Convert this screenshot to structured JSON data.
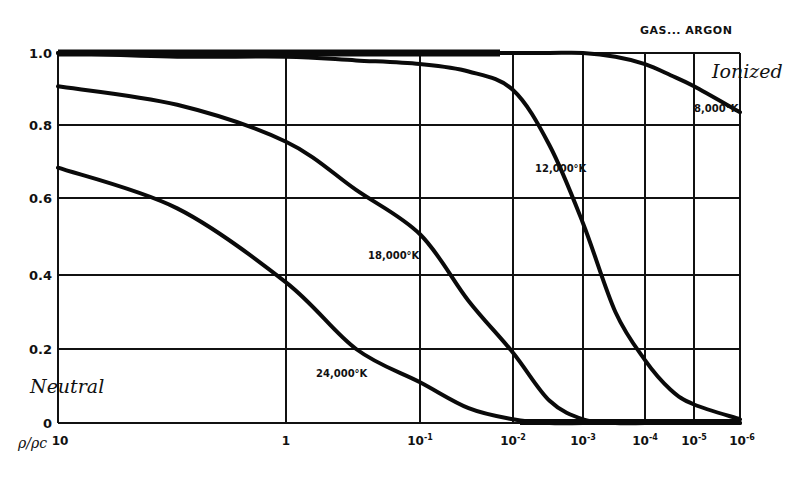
{
  "chart_data": {
    "type": "line",
    "title": "GAS... ARGON",
    "xlabel": "ρ/ρc",
    "ylabel": "",
    "x_scale": "log (decreasing left to right)",
    "xlim": [
      10,
      1e-06
    ],
    "ylim": [
      0,
      1.0
    ],
    "grid": true,
    "legend": "none (curves labeled inline)",
    "y_ticks": [
      "0",
      "0.2",
      "0.4",
      "0.6",
      "0.8",
      "1.0"
    ],
    "x_ticks": [
      {
        "base": "10",
        "exp": ""
      },
      {
        "base": "1",
        "exp": ""
      },
      {
        "base": "10",
        "exp": "-1"
      },
      {
        "base": "10",
        "exp": "-2"
      },
      {
        "base": "10",
        "exp": "-3"
      },
      {
        "base": "10",
        "exp": "-4"
      },
      {
        "base": "10",
        "exp": "-5"
      },
      {
        "base": "10",
        "exp": "-6"
      }
    ],
    "annotations": {
      "ionized": "Ionized",
      "neutral": "Neutral"
    },
    "x": [
      10,
      3,
      1,
      0.3,
      0.1,
      0.03,
      0.01,
      0.003,
      0.001,
      0.0003,
      0.0001,
      3e-05,
      1e-05,
      1e-06
    ],
    "series": [
      {
        "name": "8,000°K",
        "label": "8,000°K",
        "values": [
          1.0,
          1.0,
          1.0,
          1.0,
          1.0,
          1.0,
          1.0,
          1.0,
          1.0,
          0.99,
          0.97,
          0.94,
          0.91,
          0.84
        ]
      },
      {
        "name": "12,000°K",
        "label": "12,000°K",
        "values": [
          1.0,
          0.99,
          0.99,
          0.98,
          0.97,
          0.95,
          0.9,
          0.75,
          0.54,
          0.3,
          0.17,
          0.09,
          0.05,
          0.01
        ]
      },
      {
        "name": "18,000°K",
        "label": "18,000°K",
        "values": [
          0.91,
          0.86,
          0.76,
          0.63,
          0.51,
          0.33,
          0.19,
          0.06,
          0.01,
          0.0,
          0.0,
          0.0,
          0.0,
          0.0
        ]
      },
      {
        "name": "24,000°K",
        "label": "24,000°K",
        "values": [
          0.69,
          0.58,
          0.38,
          0.2,
          0.11,
          0.04,
          0.01,
          0.0,
          0.0,
          0.0,
          0.0,
          0.0,
          0.0,
          0.0
        ]
      }
    ]
  }
}
